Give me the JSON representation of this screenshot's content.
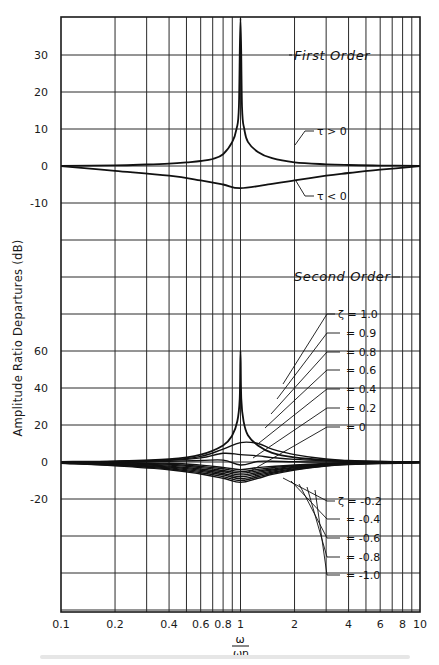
{
  "chart_data": [
    {
      "type": "line",
      "title": "First Order",
      "xlabel": "ω/ωn",
      "ylabel": "Amplitude Ratio Departures (dB)",
      "xscale": "log",
      "xlim": [
        0.1,
        10
      ],
      "ylim": [
        -15,
        40
      ],
      "yticks": [
        -10,
        0,
        10,
        20,
        30
      ],
      "series": [
        {
          "name": "τ>0",
          "label": "τ > 0",
          "x": [
            0.1,
            0.2,
            0.3,
            0.4,
            0.5,
            0.6,
            0.7,
            0.8,
            0.9,
            0.95,
            0.98,
            1.0,
            1.02,
            1.05,
            1.1,
            1.25,
            1.5,
            2,
            3,
            4,
            6,
            10
          ],
          "y": [
            0.04,
            0.17,
            0.4,
            0.64,
            0.97,
            1.34,
            1.9,
            3.2,
            6.5,
            10,
            16,
            40,
            16,
            10,
            6.5,
            3.8,
            2.1,
            1.0,
            0.45,
            0.26,
            0.12,
            0.04
          ]
        },
        {
          "name": "τ<0",
          "label": "τ < 0",
          "x": [
            0.1,
            0.2,
            0.4,
            0.6,
            0.8,
            1.0,
            1.5,
            2,
            3,
            4,
            6,
            10
          ],
          "y": [
            -0.04,
            -1.3,
            -2.6,
            -3.9,
            -5.0,
            -6.0,
            -4.8,
            -3.9,
            -2.6,
            -1.9,
            -1.0,
            -0.04
          ]
        }
      ]
    },
    {
      "type": "line",
      "title": "Second Order",
      "xlabel": "ω/ωn",
      "ylabel": "Amplitude Ratio Departures (dB)",
      "xscale": "log",
      "xlim": [
        0.1,
        10
      ],
      "ylim": [
        -40,
        70
      ],
      "yticks": [
        -20,
        0,
        20,
        40,
        60
      ],
      "series": [
        {
          "name": "ζ = 0",
          "x": [
            0.1,
            0.2,
            0.4,
            0.6,
            0.8,
            0.9,
            0.96,
            0.99,
            1.0,
            1.01,
            1.04,
            1.1,
            1.25,
            1.5,
            2,
            3,
            4,
            6,
            10
          ],
          "y": [
            0.1,
            0.4,
            1.5,
            4.0,
            9.0,
            14.5,
            22,
            34,
            60,
            34,
            22,
            14.5,
            9.0,
            5.0,
            2.5,
            1.0,
            0.5,
            0.2,
            0.1
          ]
        },
        {
          "name": "ζ = 0.2",
          "x": [
            0.1,
            0.2,
            0.4,
            0.6,
            0.8,
            1.0,
            1.25,
            1.5,
            2,
            3,
            4,
            6,
            10
          ],
          "y": [
            0.1,
            0.3,
            1.1,
            3.0,
            7.0,
            10.5,
            10.0,
            7.0,
            4.0,
            1.6,
            0.8,
            0.3,
            0.1
          ]
        },
        {
          "name": "ζ = 0.4",
          "x": [
            0.1,
            0.2,
            0.4,
            0.6,
            0.8,
            1.0,
            1.25,
            1.5,
            2,
            3,
            4,
            6,
            10
          ],
          "y": [
            0.05,
            0.25,
            0.9,
            2.2,
            4.7,
            4.0,
            3.3,
            2.4,
            1.4,
            0.6,
            0.3,
            0.1,
            0.05
          ]
        },
        {
          "name": "ζ = 0.6",
          "x": [
            0.1,
            0.2,
            0.4,
            0.6,
            0.8,
            1.0,
            1.25,
            1.5,
            2,
            3,
            4,
            6,
            10
          ],
          "y": [
            0.0,
            0.1,
            0.4,
            0.8,
            1.0,
            -1.6,
            0.3,
            0.4,
            0.1,
            0.0,
            0.0,
            0.0,
            0.0
          ]
        },
        {
          "name": "ζ = 0.8",
          "x": [
            0.1,
            0.2,
            0.4,
            0.6,
            0.8,
            1.0,
            1.25,
            1.5,
            2,
            3,
            4,
            6,
            10
          ],
          "y": [
            -0.1,
            -0.2,
            -0.7,
            -1.7,
            -2.9,
            -4.1,
            -3.0,
            -2.4,
            -1.6,
            -0.8,
            -0.45,
            -0.2,
            -0.1
          ]
        },
        {
          "name": "ζ = 0.9",
          "x": [
            0.1,
            0.2,
            0.4,
            0.6,
            0.8,
            1.0,
            1.25,
            1.5,
            2,
            3,
            4,
            6,
            10
          ],
          "y": [
            -0.15,
            -0.4,
            -1.2,
            -2.4,
            -3.7,
            -5.1,
            -4.0,
            -3.1,
            -2.0,
            -1.0,
            -0.6,
            -0.3,
            -0.15
          ]
        },
        {
          "name": "ζ = 1.0",
          "x": [
            0.1,
            0.2,
            0.4,
            0.6,
            0.8,
            1.0,
            1.25,
            1.5,
            2,
            3,
            4,
            6,
            10
          ],
          "y": [
            -0.2,
            -0.6,
            -1.7,
            -3.0,
            -4.6,
            -6.0,
            -4.8,
            -3.8,
            -2.4,
            -1.2,
            -0.7,
            -0.35,
            -0.2
          ]
        },
        {
          "name": "ζ = -0.2",
          "x": [
            0.1,
            0.2,
            0.4,
            0.6,
            0.8,
            1.0,
            1.25,
            1.5,
            2,
            3,
            4,
            6,
            10
          ],
          "y": [
            -0.3,
            -0.9,
            -2.2,
            -3.8,
            -5.3,
            -7.0,
            -5.6,
            -4.3,
            -2.8,
            -1.4,
            -0.8,
            -0.4,
            -0.2
          ]
        },
        {
          "name": "ζ = -0.4",
          "x": [
            0.1,
            0.2,
            0.4,
            0.6,
            0.8,
            1.0,
            1.25,
            1.5,
            2,
            3,
            4,
            6,
            10
          ],
          "y": [
            -0.4,
            -1.2,
            -2.7,
            -4.5,
            -6.2,
            -8.0,
            -6.4,
            -4.9,
            -3.2,
            -1.6,
            -0.95,
            -0.5,
            -0.25
          ]
        },
        {
          "name": "ζ = -0.6",
          "x": [
            0.1,
            0.2,
            0.4,
            0.6,
            0.8,
            1.0,
            1.25,
            1.5,
            2,
            3,
            4,
            6,
            10
          ],
          "y": [
            -0.5,
            -1.5,
            -3.2,
            -5.1,
            -7.0,
            -9.0,
            -7.2,
            -5.5,
            -3.6,
            -1.8,
            -1.1,
            -0.6,
            -0.3
          ]
        },
        {
          "name": "ζ = -0.8",
          "x": [
            0.1,
            0.2,
            0.4,
            0.6,
            0.8,
            1.0,
            1.25,
            1.5,
            2,
            3,
            4,
            6,
            10
          ],
          "y": [
            -0.6,
            -1.8,
            -3.7,
            -5.8,
            -7.9,
            -10.0,
            -8.0,
            -6.1,
            -4.0,
            -2.0,
            -1.25,
            -0.7,
            -0.35
          ]
        },
        {
          "name": "ζ = -1.0",
          "x": [
            0.1,
            0.2,
            0.4,
            0.6,
            0.8,
            1.0,
            1.25,
            1.5,
            2,
            3,
            4,
            6,
            10
          ],
          "y": [
            -0.7,
            -2.1,
            -4.2,
            -6.5,
            -8.8,
            -11.0,
            -8.8,
            -6.7,
            -4.4,
            -2.2,
            -1.4,
            -0.8,
            -0.4
          ]
        }
      ]
    }
  ],
  "axes": {
    "ylabel": "Amplitude Ratio Departures (dB)",
    "xlabel_num": "ω",
    "xlabel_den": "ωn",
    "xticks": [
      {
        "v": 0.1,
        "label": "0.1"
      },
      {
        "v": 0.2,
        "label": "0.2"
      },
      {
        "v": 0.4,
        "label": "0.4"
      },
      {
        "v": 0.6,
        "label": "0.6"
      },
      {
        "v": 0.8,
        "label": "0.8"
      },
      {
        "v": 1,
        "label": "1"
      },
      {
        "v": 2,
        "label": "2"
      },
      {
        "v": 4,
        "label": "4"
      },
      {
        "v": 6,
        "label": "6"
      },
      {
        "v": 8,
        "label": "8"
      },
      {
        "v": 10,
        "label": "10"
      }
    ],
    "first_order_yticks": [
      {
        "v": 30,
        "label": "30"
      },
      {
        "v": 20,
        "label": "20"
      },
      {
        "v": 10,
        "label": "10"
      },
      {
        "v": 0,
        "label": "0"
      },
      {
        "v": -10,
        "label": "-10"
      }
    ],
    "second_order_yticks": [
      {
        "v": 60,
        "label": "60"
      },
      {
        "v": 40,
        "label": "40"
      },
      {
        "v": 20,
        "label": "20"
      },
      {
        "v": 0,
        "label": "0"
      },
      {
        "v": -20,
        "label": "-20"
      }
    ]
  },
  "labels": {
    "first_order": "First Order",
    "second_order": "Second Order",
    "tau_pos": "τ > 0",
    "tau_neg": "τ < 0",
    "zeta_pos": [
      "ζ = 1.0",
      "= 0.9",
      "= 0.8",
      "= 0.6",
      "= 0.4",
      "= 0.2",
      "= 0"
    ],
    "zeta_neg": [
      "ζ = -0.2",
      "= -0.4",
      "= -0.6",
      "= -0.8",
      "= -1.0"
    ]
  }
}
